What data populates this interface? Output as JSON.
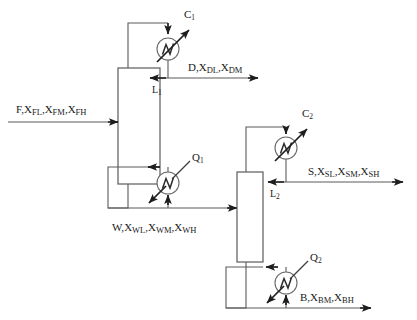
{
  "diagram": {
    "type": "process-flow-diagram",
    "background_color": "#ffffff",
    "line_color": "#5a5a5a",
    "arrow_color": "#1d1d1d"
  },
  "units": {
    "column1": {
      "name": "column-1",
      "x": 118,
      "y": 68,
      "width": 42,
      "height": 116
    },
    "column2": {
      "name": "column-2",
      "x": 237,
      "y": 172,
      "width": 26,
      "height": 90
    },
    "condenser1": {
      "name": "condenser-1",
      "cx": 168,
      "cy": 49,
      "r": 11
    },
    "reboiler1": {
      "name": "reboiler-1",
      "cx": 168,
      "cy": 183,
      "r": 11
    },
    "condenser2": {
      "name": "condenser-2",
      "cx": 286,
      "cy": 148,
      "r": 11
    },
    "reboiler2": {
      "name": "reboiler-2",
      "cx": 286,
      "cy": 283,
      "r": 11
    }
  },
  "streams": {
    "feed": {
      "id": "F",
      "label_main": "F,",
      "components": [
        "X",
        "X",
        "X"
      ],
      "subscripts": [
        "FL",
        "FM",
        "FH"
      ],
      "text": "F,XFL,XFM,XFH"
    },
    "distillate1": {
      "id": "D",
      "label_main": "D,",
      "subscripts": [
        "DL",
        "DM"
      ],
      "text": "D,XDL,XDM"
    },
    "bottoms1": {
      "id": "W",
      "label_main": "W,",
      "subscripts": [
        "WL",
        "WM",
        "WH"
      ],
      "text": "W,XWL,XWM,XWH"
    },
    "sidestream2": {
      "id": "S",
      "label_main": "S,",
      "subscripts": [
        "SL",
        "SM",
        "SH"
      ],
      "text": "S,XSL,XSM,XSH"
    },
    "bottoms2": {
      "id": "B",
      "label_main": "B,",
      "subscripts": [
        "BM",
        "BH"
      ],
      "text": "B,XBM,XBH"
    }
  },
  "labels": {
    "condenser_duty_1": {
      "base": "C",
      "sub": "1"
    },
    "condenser_duty_2": {
      "base": "C",
      "sub": "2"
    },
    "reboiler_duty_1": {
      "base": "Q",
      "sub": "1"
    },
    "reboiler_duty_2": {
      "base": "Q",
      "sub": "2"
    },
    "reflux_1": {
      "base": "L",
      "sub": "1"
    },
    "reflux_2": {
      "base": "L",
      "sub": "2"
    },
    "feed_base": "F,",
    "distillate_base": "D,",
    "waste_base": "W,",
    "side_base": "S,",
    "bottom_base": "B,",
    "x_symbol": "X",
    "comma": ",",
    "sub_FL": "FL",
    "sub_FM": "FM",
    "sub_FH": "FH",
    "sub_DL": "DL",
    "sub_DM": "DM",
    "sub_WL": "WL",
    "sub_WM": "WM",
    "sub_WH": "WH",
    "sub_SL": "SL",
    "sub_SM": "SM",
    "sub_SH": "SH",
    "sub_BM": "BM",
    "sub_BH": "BH"
  }
}
